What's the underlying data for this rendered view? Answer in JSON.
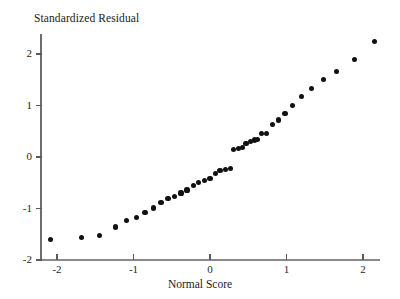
{
  "chart_data": {
    "type": "scatter",
    "title": "Standardized Residual",
    "xlabel": "Normal Score",
    "ylabel": "Standardized Residual",
    "grid": false,
    "legend": null,
    "xlim": [
      -2.35,
      2.35
    ],
    "ylim": [
      -2.05,
      2.45
    ],
    "xticks": [
      -2,
      -1,
      0,
      1,
      2
    ],
    "yticks": [
      -2,
      -1,
      0,
      1,
      2
    ],
    "xtick_labels": [
      "-2",
      "-1",
      "0",
      "1",
      "2"
    ],
    "ytick_labels": [
      "-2",
      "-1",
      "0",
      "1",
      "2"
    ],
    "marker": "filled-circle",
    "marker_color": "#111111",
    "axis_color": "#6e6e6e",
    "n_points": 40,
    "x": [
      -2.09,
      -1.68,
      -1.44,
      -1.24,
      -1.09,
      -0.96,
      -0.85,
      -0.74,
      -0.64,
      -0.55,
      -0.46,
      -0.38,
      -0.3,
      -0.22,
      -0.15,
      -0.07,
      0.0,
      0.07,
      0.13,
      0.2,
      0.27,
      0.31,
      0.37,
      0.42,
      0.47,
      0.53,
      0.58,
      0.62,
      0.67,
      0.74,
      0.82,
      0.9,
      0.98,
      1.08,
      1.2,
      1.33,
      1.48,
      1.65,
      1.89,
      2.15
    ],
    "y": [
      -1.6,
      -1.57,
      -1.53,
      -1.36,
      -1.24,
      -1.17,
      -1.08,
      -0.99,
      -0.89,
      -0.81,
      -0.76,
      -0.7,
      -0.64,
      -0.55,
      -0.49,
      -0.46,
      -0.42,
      -0.32,
      -0.27,
      -0.24,
      -0.22,
      0.15,
      0.17,
      0.19,
      0.26,
      0.3,
      0.33,
      0.34,
      0.45,
      0.46,
      0.63,
      0.72,
      0.85,
      1.0,
      1.17,
      1.33,
      1.5,
      1.66,
      1.9,
      2.24
    ],
    "points": [
      {
        "x": -2.09,
        "y": -1.6
      },
      {
        "x": -1.68,
        "y": -1.57
      },
      {
        "x": -1.44,
        "y": -1.53
      },
      {
        "x": -1.24,
        "y": -1.36
      },
      {
        "x": -1.09,
        "y": -1.24
      },
      {
        "x": -0.96,
        "y": -1.17
      },
      {
        "x": -0.85,
        "y": -1.08
      },
      {
        "x": -0.74,
        "y": -0.99
      },
      {
        "x": -0.64,
        "y": -0.89
      },
      {
        "x": -0.55,
        "y": -0.81
      },
      {
        "x": -0.46,
        "y": -0.76
      },
      {
        "x": -0.38,
        "y": -0.7
      },
      {
        "x": -0.3,
        "y": -0.64
      },
      {
        "x": -0.22,
        "y": -0.55
      },
      {
        "x": -0.15,
        "y": -0.49
      },
      {
        "x": -0.07,
        "y": -0.46
      },
      {
        "x": 0.0,
        "y": -0.42
      },
      {
        "x": 0.07,
        "y": -0.32
      },
      {
        "x": 0.13,
        "y": -0.27
      },
      {
        "x": 0.2,
        "y": -0.24
      },
      {
        "x": 0.27,
        "y": -0.22
      },
      {
        "x": 0.31,
        "y": 0.15
      },
      {
        "x": 0.37,
        "y": 0.17
      },
      {
        "x": 0.42,
        "y": 0.19
      },
      {
        "x": 0.47,
        "y": 0.26
      },
      {
        "x": 0.53,
        "y": 0.3
      },
      {
        "x": 0.58,
        "y": 0.33
      },
      {
        "x": 0.62,
        "y": 0.34
      },
      {
        "x": 0.67,
        "y": 0.45
      },
      {
        "x": 0.74,
        "y": 0.46
      },
      {
        "x": 0.82,
        "y": 0.63
      },
      {
        "x": 0.9,
        "y": 0.72
      },
      {
        "x": 0.98,
        "y": 0.85
      },
      {
        "x": 1.08,
        "y": 1.0
      },
      {
        "x": 1.2,
        "y": 1.17
      },
      {
        "x": 1.33,
        "y": 1.33
      },
      {
        "x": 1.48,
        "y": 1.5
      },
      {
        "x": 1.65,
        "y": 1.66
      },
      {
        "x": 1.89,
        "y": 1.9
      },
      {
        "x": 2.15,
        "y": 2.24
      }
    ]
  }
}
